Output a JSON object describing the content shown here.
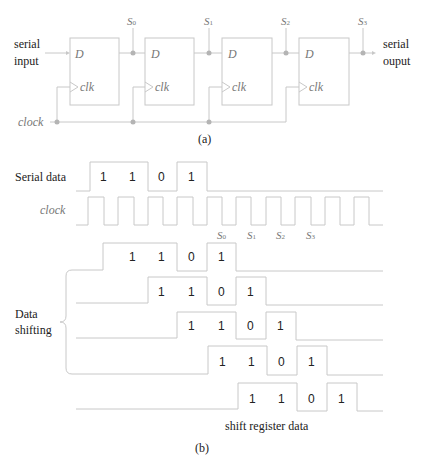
{
  "figure": {
    "part_a": {
      "caption": "(a)",
      "input_label": [
        "serial",
        "input"
      ],
      "output_label": [
        "serial",
        "ouput"
      ],
      "clock_label": "clock",
      "flip_flops": [
        {
          "d_label": "D",
          "clk_label": "clk",
          "output": "S0"
        },
        {
          "d_label": "D",
          "clk_label": "clk",
          "output": "S1"
        },
        {
          "d_label": "D",
          "clk_label": "clk",
          "output": "S2"
        },
        {
          "d_label": "D",
          "clk_label": "clk",
          "output": "S3"
        }
      ],
      "outputs": [
        {
          "sym": "S",
          "sub": "0"
        },
        {
          "sym": "S",
          "sub": "1"
        },
        {
          "sym": "S",
          "sub": "2"
        },
        {
          "sym": "S",
          "sub": "3"
        }
      ]
    },
    "part_b": {
      "caption": "(b)",
      "serial_data_label": "Serial data",
      "serial_data_bits": [
        "1",
        "1",
        "0",
        "1"
      ],
      "clock_label": "clock",
      "clock_markers": [
        {
          "sym": "S",
          "sub": "0"
        },
        {
          "sym": "S",
          "sub": "1"
        },
        {
          "sym": "S",
          "sub": "2"
        },
        {
          "sym": "S",
          "sub": "3"
        }
      ],
      "shifting_label": [
        "Data",
        "shifting"
      ],
      "shift_rows": [
        [
          "1",
          "1",
          "0",
          "1"
        ],
        [
          "1",
          "1",
          "0",
          "1"
        ],
        [
          "1",
          "1",
          "0",
          "1"
        ],
        [
          "1",
          "1",
          "0",
          "1"
        ],
        [
          "1",
          "1",
          "0",
          "1"
        ]
      ],
      "bottom_label": "shift register data"
    },
    "colors": {
      "line": "#c8c8c8",
      "dot": "#b4b4b4",
      "text": "#222222",
      "italic_text": "#777777"
    }
  }
}
